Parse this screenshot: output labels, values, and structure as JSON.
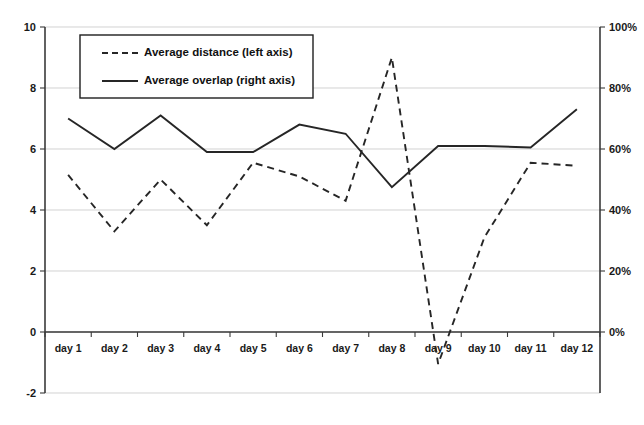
{
  "chart_data": {
    "type": "line",
    "title": "",
    "xlabel": "",
    "ylabel": "",
    "grid": true,
    "legend_position": "top-left-inside",
    "categories": [
      "day 1",
      "day 2",
      "day 3",
      "day 4",
      "day 5",
      "day 6",
      "day 7",
      "day 8",
      "day 9",
      "day 10",
      "day 11",
      "day 12"
    ],
    "left_axis": {
      "label": "Average distance (left axis)",
      "ylim": [
        -2,
        10
      ],
      "ticks": [
        -2,
        0,
        2,
        4,
        6,
        8,
        10
      ],
      "tick_labels": [
        "-2",
        "0",
        "2",
        "4",
        "6",
        "8",
        "10"
      ]
    },
    "right_axis": {
      "label": "Average overlap (right axis)",
      "ylim": [
        0,
        100
      ],
      "ticks": [
        0,
        20,
        40,
        60,
        80,
        100
      ],
      "tick_labels": [
        "0%",
        "20%",
        "40%",
        "60%",
        "80%",
        "100%"
      ]
    },
    "series": [
      {
        "name": "Average distance (left axis)",
        "axis": "left",
        "style": "dashed",
        "color": "#262626",
        "values": [
          5.15,
          3.3,
          5.0,
          3.5,
          5.55,
          5.1,
          4.3,
          9.0,
          -1.05,
          3.1,
          5.55,
          5.45
        ]
      },
      {
        "name": "Average overlap (right axis)",
        "axis": "right",
        "style": "solid",
        "color": "#262626",
        "values": [
          70,
          60,
          71,
          59,
          59,
          68,
          65,
          47.5,
          61,
          61,
          60.5,
          73
        ]
      }
    ]
  },
  "legend": {
    "entries": [
      {
        "label": "Average distance (left axis)",
        "style": "dashed"
      },
      {
        "label": "Average overlap (right axis)",
        "style": "solid"
      }
    ]
  }
}
